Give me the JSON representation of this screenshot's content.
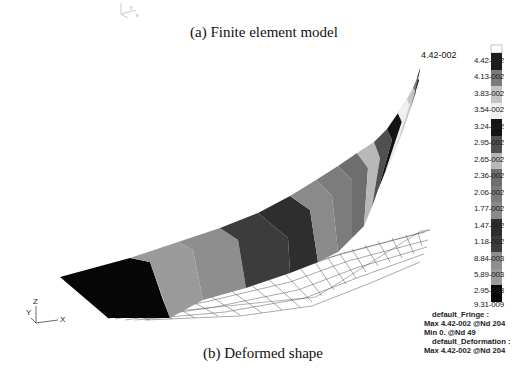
{
  "figure": {
    "caption_a": "(a) Finite element model",
    "caption_b": "(b) Deformed shape"
  },
  "top_triad": {
    "labels": [
      "Y",
      "X"
    ]
  },
  "bottom_triad": {
    "labels": [
      "Z",
      "Y",
      "X"
    ]
  },
  "peak_marker": "4.42-002",
  "legend": {
    "values": [
      "4.42-002",
      "4.13-002",
      "3.83-002",
      "3.54-002",
      "3.24-002",
      "2.95-002",
      "2.65-002",
      "2.36-002",
      "2.06-002",
      "1.77-002",
      "1.47-002",
      "1.18-002",
      "8.84-003",
      "5.89-003",
      "2.95-003",
      "9.31-009"
    ],
    "band_colors": [
      "#ffffff",
      "#1c1c1c",
      "#7a7a7a",
      "#c4c4c4",
      "#f0f0f0",
      "#141414",
      "#505050",
      "#b8b8b8",
      "#6e6e6e",
      "#7c7c7c",
      "#8a8a8a",
      "#2e2e2e",
      "#3c3c3c",
      "#8e8e8e",
      "#9a9a9a",
      "#060606"
    ]
  },
  "info": {
    "fringe_title": "default_Fringe :",
    "fringe_max": "Max 4.42-002 @Nd 204",
    "fringe_min": "Min  0. @Nd 49",
    "deformation_title": "default_Deformation :",
    "deformation_max": "Max 4.42-002 @Nd 204"
  }
}
